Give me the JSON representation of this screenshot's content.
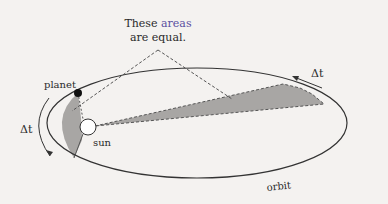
{
  "diagram": {
    "annotation_line1_prefix": "These ",
    "annotation_line1_highlight": "areas",
    "annotation_line2": "are equal.",
    "planet_label": "planet",
    "sun_label": "sun",
    "orbit_label": "orbit",
    "delta_t_left": "Δt",
    "delta_t_right": "Δt",
    "colors": {
      "background": "#f4f2f0",
      "line": "#333333",
      "shade": "#a8a6a4",
      "highlight_text": "#5a4fa0"
    }
  }
}
